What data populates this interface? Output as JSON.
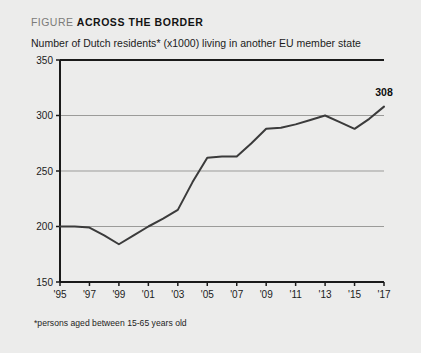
{
  "header": {
    "kicker": "FIGURE",
    "title": "ACROSS THE BORDER"
  },
  "subtitle": "Number of Dutch residents* (x1000) living in another EU member state",
  "footnote": "*persons aged between 15-65 years old",
  "colors": {
    "background": "#ececeb",
    "line": "#3b3b3b",
    "axis": "#1a1a1a",
    "grid": "#9b9b99",
    "text": "#1b1b1b",
    "kicker": "#7b7b79"
  },
  "chart_data": {
    "type": "line",
    "title": "ACROSS THE BORDER",
    "subtitle": "Number of Dutch residents* (x1000) living in another EU member state",
    "xlabel": "",
    "ylabel": "",
    "ylim": [
      150,
      350
    ],
    "xlim": [
      1995,
      2017
    ],
    "yticks": [
      150,
      200,
      250,
      300,
      350
    ],
    "ytick_labels": [
      "150",
      "200",
      "250",
      "300",
      "350"
    ],
    "xticks": [
      1995,
      1997,
      1999,
      2001,
      2003,
      2005,
      2007,
      2009,
      2011,
      2013,
      2015,
      2017
    ],
    "xtick_labels": [
      "'95",
      "'97",
      "'99",
      "'01",
      "'03",
      "'05",
      "'07",
      "'09",
      "'11",
      "'13",
      "'15",
      "'17"
    ],
    "grid": true,
    "legend": false,
    "x": [
      1995,
      1996,
      1997,
      1998,
      1999,
      2000,
      2001,
      2002,
      2003,
      2004,
      2005,
      2006,
      2007,
      2008,
      2009,
      2010,
      2011,
      2012,
      2013,
      2014,
      2015,
      2016,
      2017
    ],
    "values": [
      200,
      200,
      199,
      192,
      184,
      192,
      200,
      207,
      215,
      240,
      262,
      263,
      263,
      275,
      288,
      289,
      292,
      296,
      300,
      294,
      288,
      297,
      308
    ],
    "annotations": [
      {
        "x": 2017,
        "y": 308,
        "text": "308"
      }
    ]
  }
}
